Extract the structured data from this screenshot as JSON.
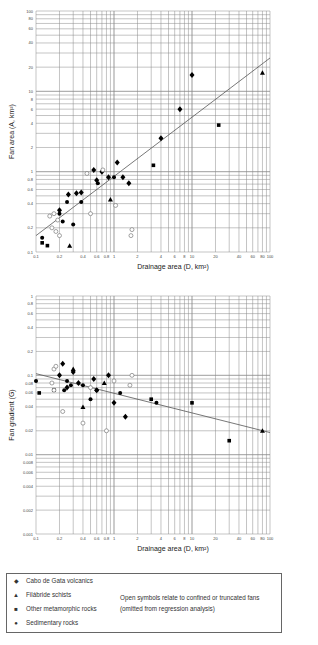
{
  "chart_data": [
    {
      "type": "scatter",
      "title": "",
      "xlabel": "Drainage area (D, km²)",
      "ylabel": "Fan area (A, km²)",
      "xscale": "log",
      "yscale": "log",
      "xlim": [
        0.1,
        100
      ],
      "ylim": [
        0.1,
        100
      ],
      "x_ticks": [
        "0.1",
        "0.2",
        "0.4",
        "0.6",
        "0.8",
        "1",
        "2",
        "4",
        "6",
        "8",
        "10",
        "20",
        "40",
        "60",
        "80",
        "100"
      ],
      "y_ticks": [
        "0.1",
        "0.2",
        "0.4",
        "0.6",
        "0.8",
        "1",
        "2",
        "4",
        "6",
        "8",
        "10",
        "20",
        "40",
        "60",
        "80",
        "100"
      ],
      "grid": true,
      "regression_line": {
        "x": [
          0.1,
          100
        ],
        "y": [
          0.16,
          26
        ]
      },
      "series": [
        {
          "name": "Cabo de Gata volcanics",
          "marker": "filled-diamond",
          "points": [
            [
              0.2,
              0.33
            ],
            [
              0.26,
              0.52
            ],
            [
              0.33,
              0.54
            ],
            [
              0.38,
              0.55
            ],
            [
              0.55,
              1.05
            ],
            [
              0.6,
              0.78
            ],
            [
              0.7,
              1.0
            ],
            [
              0.85,
              0.85
            ],
            [
              1.1,
              1.3
            ],
            [
              1.3,
              0.85
            ],
            [
              1.55,
              0.72
            ],
            [
              4,
              2.6
            ],
            [
              7,
              6
            ],
            [
              10,
              16
            ]
          ]
        },
        {
          "name": "Sedimentary rocks",
          "marker": "filled-circle",
          "points": [
            [
              0.12,
              0.15
            ],
            [
              0.2,
              0.3
            ],
            [
              0.22,
              0.24
            ],
            [
              0.25,
              0.42
            ],
            [
              0.3,
              0.22
            ],
            [
              0.38,
              0.42
            ],
            [
              0.62,
              0.72
            ],
            [
              1.0,
              0.85
            ]
          ]
        },
        {
          "name": "Other metamorphic rocks",
          "marker": "filled-square",
          "points": [
            [
              0.12,
              0.13
            ],
            [
              0.14,
              0.12
            ],
            [
              3.2,
              1.2
            ],
            [
              22,
              3.8
            ]
          ]
        },
        {
          "name": "Filábride schists",
          "marker": "filled-triangle",
          "points": [
            [
              0.27,
              0.12
            ],
            [
              0.9,
              0.45
            ],
            [
              80,
              17
            ]
          ]
        },
        {
          "name": "Open (confined/truncated)",
          "marker": "open",
          "points": [
            [
              0.15,
              0.28
            ],
            [
              0.17,
              0.3
            ],
            [
              0.19,
              0.25
            ],
            [
              0.16,
              0.2
            ],
            [
              0.18,
              0.18
            ],
            [
              0.2,
              0.16
            ],
            [
              0.5,
              0.3
            ],
            [
              0.45,
              0.95
            ],
            [
              0.72,
              1.05
            ],
            [
              1.05,
              0.38
            ],
            [
              1.7,
              0.19
            ],
            [
              1.65,
              0.16
            ]
          ]
        }
      ]
    },
    {
      "type": "scatter",
      "title": "",
      "xlabel": "Drainage area (D, km²)",
      "ylabel": "Fan gradient (G)",
      "xscale": "log",
      "yscale": "log",
      "xlim": [
        0.1,
        100
      ],
      "ylim": [
        0.001,
        1
      ],
      "x_ticks": [
        "0.1",
        "0.2",
        "0.4",
        "0.6",
        "0.8",
        "1",
        "2",
        "4",
        "6",
        "8",
        "10",
        "20",
        "40",
        "60",
        "80",
        "100"
      ],
      "y_ticks": [
        "0.001",
        "0.002",
        "0.004",
        "0.006",
        "0.008",
        "0.01",
        "0.02",
        "0.04",
        "0.06",
        "0.08",
        "0.1",
        "0.2",
        "0.4",
        "0.6",
        "0.8",
        "1"
      ],
      "grid": true,
      "regression_line": {
        "x": [
          0.1,
          100
        ],
        "y": [
          0.105,
          0.019
        ]
      },
      "series": [
        {
          "name": "Cabo de Gata volcanics",
          "marker": "filled-diamond",
          "points": [
            [
              0.2,
              0.1
            ],
            [
              0.22,
              0.14
            ],
            [
              0.3,
              0.11
            ],
            [
              0.25,
              0.07
            ],
            [
              0.35,
              0.08
            ],
            [
              0.55,
              0.09
            ],
            [
              0.6,
              0.065
            ],
            [
              0.85,
              0.1
            ],
            [
              1.0,
              0.045
            ],
            [
              1.4,
              0.03
            ]
          ]
        },
        {
          "name": "Sedimentary rocks",
          "marker": "filled-circle",
          "points": [
            [
              0.1,
              0.085
            ],
            [
              0.23,
              0.065
            ],
            [
              0.25,
              0.085
            ],
            [
              0.28,
              0.075
            ],
            [
              0.4,
              0.075
            ],
            [
              0.5,
              0.05
            ],
            [
              0.6,
              0.065
            ],
            [
              1.2,
              0.06
            ],
            [
              3.5,
              0.045
            ]
          ]
        },
        {
          "name": "Other metamorphic rocks",
          "marker": "filled-square",
          "points": [
            [
              0.11,
              0.06
            ],
            [
              0.17,
              0.065
            ],
            [
              3.0,
              0.05
            ],
            [
              10,
              0.045
            ],
            [
              30,
              0.015
            ]
          ]
        },
        {
          "name": "Filábride schists",
          "marker": "filled-triangle",
          "points": [
            [
              0.3,
              0.12
            ],
            [
              0.4,
              0.04
            ],
            [
              0.75,
              0.08
            ],
            [
              80,
              0.02
            ]
          ]
        },
        {
          "name": "Open (confined/truncated)",
          "marker": "open",
          "points": [
            [
              0.17,
              0.12
            ],
            [
              0.18,
              0.13
            ],
            [
              0.16,
              0.08
            ],
            [
              0.17,
              0.065
            ],
            [
              0.22,
              0.035
            ],
            [
              0.4,
              0.025
            ],
            [
              0.5,
              0.07
            ],
            [
              0.8,
              0.02
            ],
            [
              1.0,
              0.085
            ],
            [
              1.7,
              0.1
            ],
            [
              1.6,
              0.075
            ]
          ]
        }
      ]
    }
  ],
  "legend": {
    "items": [
      {
        "symbol": "◆",
        "label": "Cabo de Gata volcanics"
      },
      {
        "symbol": "▲",
        "label": "Filábride schists"
      },
      {
        "symbol": "■",
        "label": "Other metamorphic rocks"
      },
      {
        "symbol": "●",
        "label": "Sedimentary rocks"
      }
    ],
    "note_line1": "Open symbols relate to confined or truncated fans",
    "note_line2": "(omitted from regression analysis)"
  }
}
